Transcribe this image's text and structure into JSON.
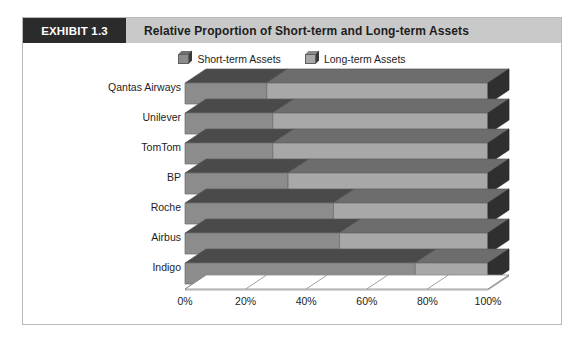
{
  "exhibit": {
    "tag": "EXHIBIT 1.3",
    "title": "Relative Proportion of Short-term and Long-term Assets"
  },
  "legend": {
    "items": [
      {
        "label": "Short-term Assets",
        "icon": "cube-icon",
        "color": "#8c8c8c"
      },
      {
        "label": "Long-term Assets",
        "icon": "cube-icon",
        "color": "#a8a8a8"
      }
    ]
  },
  "axis": {
    "x_ticks": [
      "0%",
      "20%",
      "40%",
      "60%",
      "80%",
      "100%"
    ],
    "categories": [
      "Qantas Airways",
      "Unilever",
      "TomTom",
      "BP",
      "Roche",
      "Airbus",
      "Indigo"
    ]
  },
  "colors": {
    "short_term": "#8c8c8c",
    "long_term": "#a8a8a8",
    "short_term_top": "#4a4a4a",
    "long_term_top": "#6d6d6d",
    "side_dark": "#2f2f2f",
    "header_band": "#c9c9c9",
    "tag_bg": "#2b2b2b",
    "frame_border": "#b9b9b9"
  },
  "chart_data": {
    "type": "bar",
    "orientation": "horizontal",
    "stacked": true,
    "percent": true,
    "title": "Relative Proportion of Short-term and Long-term Assets",
    "xlabel": "",
    "ylabel": "",
    "xlim": [
      0,
      100
    ],
    "grid": false,
    "legend_position": "top",
    "categories": [
      "Qantas Airways",
      "Unilever",
      "TomTom",
      "BP",
      "Roche",
      "Airbus",
      "Indigo"
    ],
    "series": [
      {
        "name": "Short-term Assets",
        "values": [
          27,
          29,
          29,
          34,
          49,
          51,
          76
        ]
      },
      {
        "name": "Long-term Assets",
        "values": [
          73,
          71,
          71,
          66,
          51,
          49,
          24
        ]
      }
    ]
  }
}
